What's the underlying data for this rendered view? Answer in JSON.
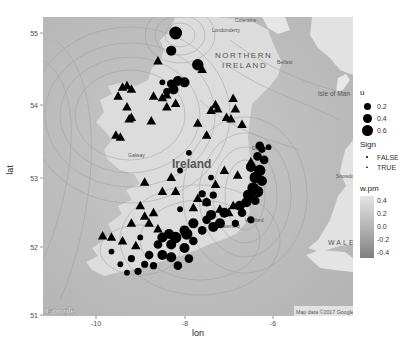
{
  "chart_data": {
    "type": "scatter",
    "subtype": "map-overlay-with-contours",
    "title": "",
    "xlabel": "lon",
    "ylabel": "lat",
    "xlim": [
      -11.2,
      -4.2
    ],
    "ylim": [
      51,
      55.2
    ],
    "x_ticks": [
      "-10",
      "-8",
      "-6"
    ],
    "y_ticks": [
      "51",
      "52",
      "53",
      "54",
      "55"
    ],
    "grid": false,
    "basemap": {
      "attribution_logo": "Google",
      "attribution_text": "Map data ©2017 Google",
      "labels": [
        {
          "text": "NORTHERN",
          "lon": -7.1,
          "lat": 54.72
        },
        {
          "text": "IRELAND",
          "lon": -7.0,
          "lat": 54.55
        },
        {
          "text": "Ireland",
          "lon": -7.9,
          "lat": 53.2
        },
        {
          "text": "Isle of Man",
          "lon": -4.6,
          "lat": 54.22
        },
        {
          "text": "WALES",
          "lon": -4.7,
          "lat": 52.2
        },
        {
          "text": "Belfast",
          "lon": -5.95,
          "lat": 54.6
        },
        {
          "text": "Galway",
          "lon": -9.0,
          "lat": 53.3
        },
        {
          "text": "Dublin",
          "lon": -6.25,
          "lat": 53.38
        },
        {
          "text": "Coleraine",
          "lon": -6.7,
          "lat": 55.1
        },
        {
          "text": "Londonderry",
          "lon": -7.3,
          "lat": 55.0
        },
        {
          "text": "Ballymena",
          "lon": -6.3,
          "lat": 54.87
        },
        {
          "text": "Wexford",
          "lon": -6.45,
          "lat": 52.35
        },
        {
          "text": "Waterford",
          "lon": -7.1,
          "lat": 52.28
        },
        {
          "text": "Snowdonia",
          "lon": -4.0,
          "lat": 53.0
        }
      ]
    },
    "legend": {
      "position": "right",
      "size": {
        "title": "u",
        "entries": [
          {
            "label": "0.2",
            "r": 3.2
          },
          {
            "label": "0.4",
            "r": 4.2
          },
          {
            "label": "0.6",
            "r": 5.2
          }
        ]
      },
      "shape": {
        "title": "Sign",
        "entries": [
          {
            "label": "FALSE",
            "shape": "circle"
          },
          {
            "label": "TRUE",
            "shape": "triangle"
          }
        ]
      },
      "fill": {
        "title": "w.pm",
        "ticks": [
          "0.4",
          "0.2",
          "0.0",
          "-0.2",
          "-0.4"
        ],
        "range": [
          -0.5,
          0.45
        ]
      }
    },
    "series": [
      {
        "name": "Sign TRUE",
        "shape": "triangle",
        "points": [
          {
            "lon": -8.6,
            "lat": 54.6
          },
          {
            "lon": -9.4,
            "lat": 54.23
          },
          {
            "lon": -9.3,
            "lat": 54.25
          },
          {
            "lon": -9.2,
            "lat": 54.2
          },
          {
            "lon": -9.5,
            "lat": 54.1
          },
          {
            "lon": -8.7,
            "lat": 54.1
          },
          {
            "lon": -8.5,
            "lat": 54.08
          },
          {
            "lon": -8.4,
            "lat": 54.12
          },
          {
            "lon": -8.2,
            "lat": 54.0
          },
          {
            "lon": -9.3,
            "lat": 53.95
          },
          {
            "lon": -9.2,
            "lat": 53.8
          },
          {
            "lon": -9.25,
            "lat": 53.78
          },
          {
            "lon": -8.75,
            "lat": 53.75
          },
          {
            "lon": -8.4,
            "lat": 53.95
          },
          {
            "lon": -9.55,
            "lat": 53.55
          },
          {
            "lon": -9.45,
            "lat": 53.52
          },
          {
            "lon": -7.6,
            "lat": 54.48
          },
          {
            "lon": -6.9,
            "lat": 54.07
          },
          {
            "lon": -7.3,
            "lat": 53.98
          },
          {
            "lon": -7.4,
            "lat": 53.9
          },
          {
            "lon": -7.25,
            "lat": 53.92
          },
          {
            "lon": -6.85,
            "lat": 53.92
          },
          {
            "lon": -7.05,
            "lat": 53.8
          },
          {
            "lon": -6.95,
            "lat": 53.78
          },
          {
            "lon": -7.7,
            "lat": 53.72
          },
          {
            "lon": -7.5,
            "lat": 53.55
          },
          {
            "lon": -6.7,
            "lat": 53.7
          },
          {
            "lon": -6.5,
            "lat": 53.17
          },
          {
            "lon": -7.1,
            "lat": 53.05
          },
          {
            "lon": -6.8,
            "lat": 52.98
          },
          {
            "lon": -8.9,
            "lat": 52.88
          },
          {
            "lon": -8.3,
            "lat": 52.95
          },
          {
            "lon": -7.3,
            "lat": 52.85
          },
          {
            "lon": -8.5,
            "lat": 52.75
          },
          {
            "lon": -8.2,
            "lat": 52.75
          },
          {
            "lon": -7.5,
            "lat": 52.6
          },
          {
            "lon": -9.0,
            "lat": 52.55
          },
          {
            "lon": -9.2,
            "lat": 52.3
          },
          {
            "lon": -8.9,
            "lat": 52.4
          },
          {
            "lon": -8.8,
            "lat": 52.3
          },
          {
            "lon": -8.6,
            "lat": 52.22
          },
          {
            "lon": -7.7,
            "lat": 52.65
          },
          {
            "lon": -7.2,
            "lat": 52.5
          },
          {
            "lon": -6.9,
            "lat": 52.55
          },
          {
            "lon": -7.0,
            "lat": 52.45
          },
          {
            "lon": -7.8,
            "lat": 52.52
          },
          {
            "lon": -8.7,
            "lat": 52.45
          },
          {
            "lon": -9.85,
            "lat": 52.12
          },
          {
            "lon": -9.65,
            "lat": 52.1
          },
          {
            "lon": -9.4,
            "lat": 52.05
          },
          {
            "lon": -9.1,
            "lat": 51.98
          }
        ]
      },
      {
        "name": "Sign FALSE",
        "shape": "circle",
        "points": [
          {
            "lon": -8.2,
            "lat": 55.0,
            "u": 0.7
          },
          {
            "lon": -8.3,
            "lat": 54.75,
            "u": 0.5
          },
          {
            "lon": -7.7,
            "lat": 54.55,
            "u": 0.6
          },
          {
            "lon": -8.0,
            "lat": 54.3,
            "u": 0.5
          },
          {
            "lon": -8.15,
            "lat": 54.32,
            "u": 0.5
          },
          {
            "lon": -8.3,
            "lat": 54.28,
            "u": 0.4
          },
          {
            "lon": -8.25,
            "lat": 54.2,
            "u": 0.5
          },
          {
            "lon": -8.4,
            "lat": 54.17,
            "u": 0.3
          },
          {
            "lon": -8.5,
            "lat": 54.3,
            "u": 0.2
          },
          {
            "lon": -8.1,
            "lat": 53.05,
            "u": 0.2
          },
          {
            "lon": -7.9,
            "lat": 53.3,
            "u": 0.2
          },
          {
            "lon": -6.3,
            "lat": 53.4,
            "u": 0.4
          },
          {
            "lon": -6.25,
            "lat": 53.35,
            "u": 0.3
          },
          {
            "lon": -6.1,
            "lat": 53.38,
            "u": 0.2
          },
          {
            "lon": -6.35,
            "lat": 53.25,
            "u": 0.4
          },
          {
            "lon": -6.2,
            "lat": 53.2,
            "u": 0.4
          },
          {
            "lon": -6.5,
            "lat": 53.1,
            "u": 0.5
          },
          {
            "lon": -6.3,
            "lat": 53.05,
            "u": 0.6
          },
          {
            "lon": -6.4,
            "lat": 52.95,
            "u": 0.6
          },
          {
            "lon": -6.25,
            "lat": 52.9,
            "u": 0.5
          },
          {
            "lon": -6.45,
            "lat": 52.8,
            "u": 0.6
          },
          {
            "lon": -6.35,
            "lat": 52.75,
            "u": 0.6
          },
          {
            "lon": -6.55,
            "lat": 52.7,
            "u": 0.6
          },
          {
            "lon": -6.6,
            "lat": 52.6,
            "u": 0.5
          },
          {
            "lon": -6.4,
            "lat": 52.62,
            "u": 0.4
          },
          {
            "lon": -6.75,
            "lat": 52.55,
            "u": 0.5
          },
          {
            "lon": -6.7,
            "lat": 52.45,
            "u": 0.4
          },
          {
            "lon": -6.85,
            "lat": 52.3,
            "u": 0.3
          },
          {
            "lon": -6.5,
            "lat": 52.35,
            "u": 0.3
          },
          {
            "lon": -7.1,
            "lat": 52.45,
            "u": 0.5
          },
          {
            "lon": -7.4,
            "lat": 52.42,
            "u": 0.5
          },
          {
            "lon": -7.5,
            "lat": 52.35,
            "u": 0.4
          },
          {
            "lon": -7.2,
            "lat": 52.3,
            "u": 0.5
          },
          {
            "lon": -7.35,
            "lat": 52.25,
            "u": 0.5
          },
          {
            "lon": -7.6,
            "lat": 52.2,
            "u": 0.4
          },
          {
            "lon": -7.8,
            "lat": 52.3,
            "u": 0.5
          },
          {
            "lon": -8.0,
            "lat": 52.2,
            "u": 0.5
          },
          {
            "lon": -7.95,
            "lat": 52.15,
            "u": 0.6
          },
          {
            "lon": -8.2,
            "lat": 52.1,
            "u": 0.6
          },
          {
            "lon": -8.35,
            "lat": 52.15,
            "u": 0.5
          },
          {
            "lon": -8.5,
            "lat": 52.1,
            "u": 0.5
          },
          {
            "lon": -8.6,
            "lat": 52.0,
            "u": 0.4
          },
          {
            "lon": -8.3,
            "lat": 52.0,
            "u": 0.5
          },
          {
            "lon": -8.0,
            "lat": 51.95,
            "u": 0.5
          },
          {
            "lon": -7.8,
            "lat": 52.05,
            "u": 0.4
          },
          {
            "lon": -8.8,
            "lat": 51.85,
            "u": 0.4
          },
          {
            "lon": -8.5,
            "lat": 51.85,
            "u": 0.5
          },
          {
            "lon": -8.7,
            "lat": 51.7,
            "u": 0.3
          },
          {
            "lon": -8.9,
            "lat": 51.72,
            "u": 0.3
          },
          {
            "lon": -9.2,
            "lat": 51.8,
            "u": 0.3
          },
          {
            "lon": -9.45,
            "lat": 51.72,
            "u": 0.2
          },
          {
            "lon": -9.05,
            "lat": 51.62,
            "u": 0.3
          },
          {
            "lon": -9.3,
            "lat": 51.6,
            "u": 0.2
          },
          {
            "lon": -8.3,
            "lat": 51.82,
            "u": 0.5
          },
          {
            "lon": -8.15,
            "lat": 51.7,
            "u": 0.4
          },
          {
            "lon": -7.9,
            "lat": 51.8,
            "u": 0.4
          },
          {
            "lon": -7.5,
            "lat": 52.6,
            "u": 0.4
          },
          {
            "lon": -7.35,
            "lat": 52.7,
            "u": 0.3
          },
          {
            "lon": -7.6,
            "lat": 52.72,
            "u": 0.3
          },
          {
            "lon": -8.1,
            "lat": 52.5,
            "u": 0.2
          },
          {
            "lon": -7.4,
            "lat": 52.95,
            "u": 0.2
          },
          {
            "lon": -9.0,
            "lat": 52.1,
            "u": 0.2
          },
          {
            "lon": -9.65,
            "lat": 51.9,
            "u": 0.2
          }
        ]
      }
    ]
  },
  "axes": {
    "x_title": "lon",
    "y_title": "lat",
    "x_ticks": [
      {
        "label": "-10",
        "px": 96
      },
      {
        "label": "-8",
        "px": 185
      },
      {
        "label": "-6",
        "px": 273
      }
    ],
    "y_ticks": [
      {
        "label": "55",
        "px": 33
      },
      {
        "label": "54",
        "px": 105
      },
      {
        "label": "53",
        "px": 178
      },
      {
        "label": "52",
        "px": 247
      },
      {
        "label": "51",
        "px": 315
      }
    ]
  },
  "legend": {
    "size_title": "u",
    "size_entries": [
      "0.2",
      "0.4",
      "0.6"
    ],
    "shape_title": "Sign",
    "shape_entries": [
      "FALSE",
      "TRUE"
    ],
    "fill_title": "w.pm",
    "fill_ticks": [
      "0.4",
      "0.2",
      "0.0",
      "-0.2",
      "-0.4"
    ]
  },
  "map": {
    "country_label": "Ireland",
    "ni_label_1": "NORTHERN",
    "ni_label_2": "IRELAND",
    "iom_label": "Isle of Man",
    "wales_label": "WALES",
    "google_logo": "Google",
    "attribution": "Map data ©2017 Google",
    "belfast": "Belfast",
    "galway": "Galway",
    "dublin": "Dublin",
    "coleraine": "Coleraine",
    "londonderry": "Londonderry",
    "wexford": "Wexford",
    "waterford": "Waterford",
    "snowdonia": "Snowdonia"
  }
}
